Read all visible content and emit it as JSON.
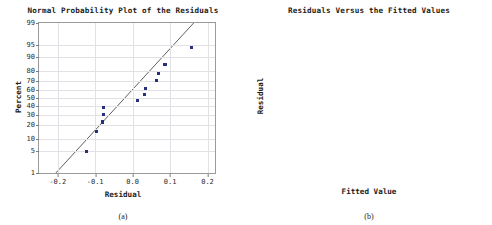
{
  "figure": {
    "panels": [
      {
        "caption": "(a)",
        "title": "Normal Probability Plot of the Residuals",
        "xlabel": "Residual",
        "ylabel": "Percent"
      },
      {
        "caption": "(b)",
        "title": "Residuals Versus the Fitted Values",
        "xlabel": "Fitted Value",
        "ylabel": "Residual"
      }
    ]
  },
  "colors": {
    "marker": "#27307a",
    "refline": "#4d4d4d",
    "gridline": "#e2e2e6",
    "frame": "#9a9a9a",
    "text": "#1a1a1a"
  },
  "chart_data": [
    {
      "type": "scatter",
      "title": "Normal Probability Plot of the Residuals",
      "xlabel": "Residual",
      "ylabel": "Percent",
      "xlim": [
        -0.25,
        0.22
      ],
      "ylim": [
        1,
        99
      ],
      "yscale": "normal-probability",
      "grid": true,
      "xticks": [
        -0.2,
        -0.1,
        0.0,
        0.1,
        0.2
      ],
      "xticklabels": [
        "-0.2",
        "-0.1",
        "0.0",
        "0.1",
        "0.2"
      ],
      "yticks": [
        1,
        5,
        10,
        20,
        30,
        40,
        50,
        60,
        70,
        80,
        90,
        95,
        99
      ],
      "yticklabels": [
        "1",
        "5",
        "10",
        "20",
        "30",
        "40",
        "50",
        "60",
        "70",
        "80",
        "90",
        "95",
        "99"
      ],
      "reference_line": {
        "label": "normal fit line",
        "x": [
          -0.205,
          0.163
        ],
        "y": [
          1,
          99
        ]
      },
      "x": [
        -0.122,
        -0.097,
        -0.081,
        -0.08,
        -0.079,
        -0.077,
        0.012,
        0.031,
        0.035,
        0.063,
        0.068,
        0.086,
        0.089,
        0.158
      ],
      "y": [
        5,
        15,
        22,
        23,
        30,
        38,
        47,
        54,
        62,
        71,
        78,
        85,
        85,
        94
      ]
    },
    {
      "type": "scatter",
      "title": "Residuals Versus the Fitted Values",
      "xlabel": "Fitted Value",
      "ylabel": "Residual",
      "xlim": [
        0.06,
        1.05
      ],
      "ylim": [
        -0.142,
        0.172
      ],
      "grid": false,
      "zero_line": 0.0,
      "xticks": [
        0.1,
        0.2,
        0.3,
        0.4,
        0.5,
        0.6,
        0.7,
        0.8,
        0.9,
        1.0
      ],
      "xticklabels": [
        "0.1",
        "0.2",
        "0.3",
        "0.4",
        "0.5",
        "0.6",
        "0.7",
        "0.8",
        "0.9",
        "1.0"
      ],
      "yticks": [
        0.15,
        0.1,
        0.05,
        0.0,
        -0.05,
        -0.1
      ],
      "yticklabels": [
        "0.15",
        "0.10",
        "0.05",
        "0.0",
        "-0.5",
        "-0.10"
      ],
      "x": [
        0.18,
        0.215,
        0.295,
        0.305,
        0.325,
        0.415,
        0.425,
        0.47,
        0.555,
        0.685,
        0.795,
        0.935
      ],
      "y": [
        0.07,
        -0.077,
        -0.1,
        -0.083,
        0.063,
        0.157,
        0.029,
        0.013,
        -0.074,
        0.087,
        -0.123,
        0.036
      ]
    }
  ]
}
